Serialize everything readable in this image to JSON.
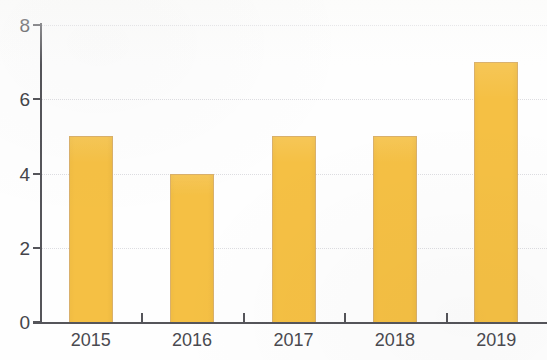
{
  "chart_data": {
    "type": "bar",
    "title": "",
    "subtitle": "",
    "xlabel": "",
    "ylabel": "",
    "categories": [
      "2015",
      "2016",
      "2017",
      "2018",
      "2019"
    ],
    "values": [
      5,
      4,
      5,
      5,
      7
    ],
    "series": [
      {
        "name": "",
        "values": [
          5,
          4,
          5,
          5,
          7
        ]
      }
    ],
    "ylim": [
      0,
      8
    ],
    "y_ticks": [
      0,
      2,
      4,
      6,
      8
    ],
    "y_tick_labels": [
      "0",
      "2",
      "4",
      "6",
      "8"
    ],
    "x_tick_labels": [
      "2015",
      "2016",
      "2017",
      "2018",
      "2019"
    ],
    "grid": true,
    "grid_axis": "y",
    "legend": false,
    "legend_position": "none",
    "annotations": [],
    "colors": {
      "bar_fill": "#F5C044",
      "bar_border": "#D9B06B",
      "axis": "#55555A",
      "grid": "#D8D8DC",
      "tick_label": "#44444A",
      "background": "#FEFEFE"
    }
  }
}
